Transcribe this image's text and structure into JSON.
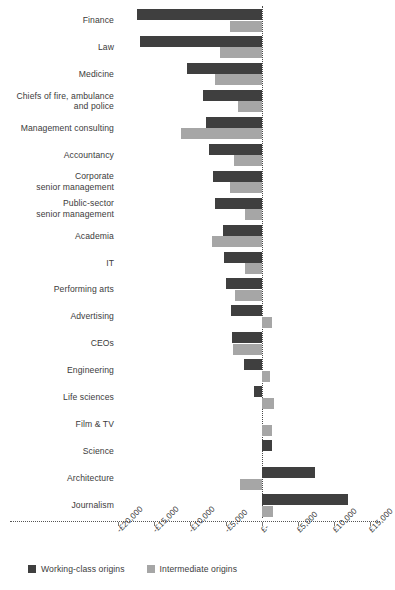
{
  "chart_data": {
    "type": "bar",
    "orientation": "horizontal",
    "title": "",
    "subtitle": "",
    "xlabel": "",
    "ylabel": "",
    "xlim": [
      -20000,
      15000
    ],
    "grid": false,
    "zero_reference_line": true,
    "legend_position": "bottom-left",
    "tick_labels": [
      "-£20,000",
      "-£15,000",
      "-£10,000",
      "-£5,000",
      "£-",
      "£5,000",
      "£10,000",
      "£15,000"
    ],
    "tick_values": [
      -20000,
      -15000,
      -10000,
      -5000,
      0,
      5000,
      10000,
      15000
    ],
    "categories": [
      "Finance",
      "Law",
      "Medicine",
      "Chiefs of fire, ambulance and police",
      "Management consulting",
      "Accountancy",
      "Corporate senior management",
      "Public-sector senior management",
      "Academia",
      "IT",
      "Performing arts",
      "Advertising",
      "CEOs",
      "Engineering",
      "Life sciences",
      "Film & TV",
      "Science",
      "Architecture",
      "Journalism"
    ],
    "series": [
      {
        "name": "Working-class origins",
        "color": "#3f3f3f",
        "values": [
          -17300,
          -17000,
          -10400,
          -8200,
          -7800,
          -7300,
          -6800,
          -6500,
          -5400,
          -5300,
          -5000,
          -4300,
          -4200,
          -2500,
          -1100,
          0,
          1400,
          7400,
          12000
        ]
      },
      {
        "name": "Intermediate origins",
        "color": "#a6a6a6",
        "values": [
          -4500,
          -5800,
          -6500,
          -3300,
          -11300,
          -3900,
          -4400,
          -2400,
          -7000,
          -2400,
          -3800,
          1400,
          -4000,
          1100,
          1700,
          1400,
          0,
          -3100,
          1500
        ]
      }
    ]
  },
  "legend": {
    "items": [
      {
        "label": "Working-class origins",
        "color": "#3f3f3f"
      },
      {
        "label": "Intermediate origins",
        "color": "#a6a6a6"
      }
    ]
  },
  "axis": {
    "ticks": [
      {
        "label": "-£20,000",
        "value": -20000
      },
      {
        "label": "-£15,000",
        "value": -15000
      },
      {
        "label": "-£10,000",
        "value": -10000
      },
      {
        "label": "-£5,000",
        "value": -5000
      },
      {
        "label": "£-",
        "value": 0
      },
      {
        "label": "£5,000",
        "value": 5000
      },
      {
        "label": "£10,000",
        "value": 10000
      },
      {
        "label": "£15,000",
        "value": 15000
      }
    ]
  },
  "categories_display": [
    {
      "lines": [
        "Finance"
      ]
    },
    {
      "lines": [
        "Law"
      ]
    },
    {
      "lines": [
        "Medicine"
      ]
    },
    {
      "lines": [
        "Chiefs of fire, ambulance",
        "and police"
      ]
    },
    {
      "lines": [
        "Management consulting"
      ]
    },
    {
      "lines": [
        "Accountancy"
      ]
    },
    {
      "lines": [
        "Corporate",
        "senior management"
      ]
    },
    {
      "lines": [
        "Public-sector",
        "senior management"
      ]
    },
    {
      "lines": [
        "Academia"
      ]
    },
    {
      "lines": [
        "IT"
      ]
    },
    {
      "lines": [
        "Performing arts"
      ]
    },
    {
      "lines": [
        "Advertising"
      ]
    },
    {
      "lines": [
        "CEOs"
      ]
    },
    {
      "lines": [
        "Engineering"
      ]
    },
    {
      "lines": [
        "Life sciences"
      ]
    },
    {
      "lines": [
        "Film & TV"
      ]
    },
    {
      "lines": [
        "Science"
      ]
    },
    {
      "lines": [
        "Architecture"
      ]
    },
    {
      "lines": [
        "Journalism"
      ]
    }
  ]
}
